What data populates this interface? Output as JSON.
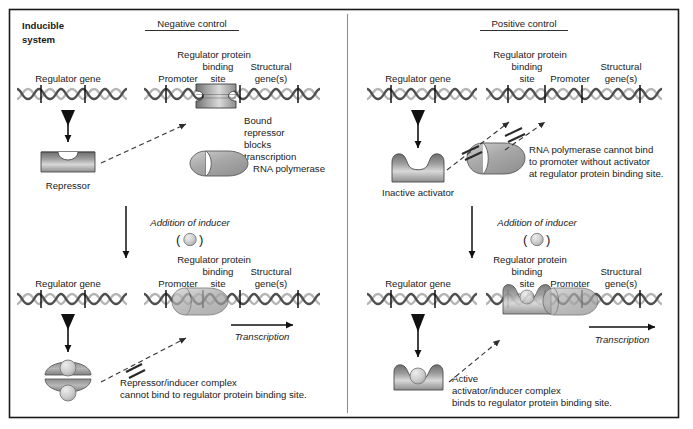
{
  "figure": {
    "title_line1": "Inducible",
    "title_line2": "system",
    "panels": [
      {
        "id": "negative",
        "heading": "Negative control"
      },
      {
        "id": "positive",
        "heading": "Positive control"
      }
    ]
  },
  "colors": {
    "background": "#ffffff",
    "border": "#1a1a1a",
    "divider": "#8a8a8a",
    "text": "#1a1a1a",
    "dna_light": "#b5b5b5",
    "dna_dark": "#4a4a4a",
    "tick": "#111111",
    "protein_light": "#e2e2e2",
    "protein_mid": "#a8a8a8",
    "protein_dark": "#6e6e6e",
    "inducer_fill": "#cfcfcf",
    "arrow": "#111111",
    "dashed_arrow": "#3a3a3a"
  },
  "negative_control": {
    "top": {
      "regulator_gene_label": "Regulator gene",
      "promoter_label": "Promoter",
      "binding_site_label_l1": "Regulator protein",
      "binding_site_label_l2": "binding",
      "binding_site_label_l3": "site",
      "structural_gene_label_l1": "Structural",
      "structural_gene_label_l2": "gene(s)",
      "repressor_label": "Repressor",
      "bound_note_l1": "Bound",
      "bound_note_l2": "repressor",
      "bound_note_l3": "blocks",
      "bound_note_l4": "transcription",
      "polymerase_label": "RNA polymerase"
    },
    "inducer_step": {
      "label": "Addition of inducer",
      "paren_open": "(",
      "paren_close": ")"
    },
    "bottom": {
      "regulator_gene_label": "Regulator gene",
      "promoter_label": "Promoter",
      "binding_site_label_l1": "Regulator protein",
      "binding_site_label_l2": "binding",
      "binding_site_label_l3": "site",
      "structural_gene_label_l1": "Structural",
      "structural_gene_label_l2": "gene(s)",
      "transcription_label": "Transcription",
      "note_l1": "Repressor/inducer complex",
      "note_l2": "cannot bind to regulator protein binding site."
    }
  },
  "positive_control": {
    "top": {
      "regulator_gene_label": "Regulator gene",
      "binding_site_label_l1": "Regulator protein",
      "binding_site_label_l2": "binding",
      "binding_site_label_l3": "site",
      "promoter_label": "Promoter",
      "structural_gene_label_l1": "Structural",
      "structural_gene_label_l2": "gene(s)",
      "activator_label": "Inactive activator",
      "note_l1": "RNA polymerase cannot bind",
      "note_l2": "to promoter without activator",
      "note_l3": "at regulator protein binding site."
    },
    "inducer_step": {
      "label": "Addition of inducer",
      "paren_open": "(",
      "paren_close": ")"
    },
    "bottom": {
      "regulator_gene_label": "Regulator gene",
      "binding_site_label_l1": "Regulator protein",
      "binding_site_label_l2": "binding",
      "binding_site_label_l3": "site",
      "promoter_label": "Promoter",
      "structural_gene_label_l1": "Structural",
      "structural_gene_label_l2": "gene(s)",
      "transcription_label": "Transcription",
      "note_l1": "Active",
      "note_l2": "activator/inducer complex",
      "note_l3": "binds to regulator protein binding site."
    }
  }
}
